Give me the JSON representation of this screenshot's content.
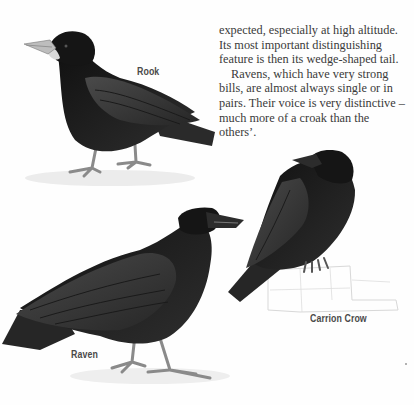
{
  "page": {
    "body_text": {
      "lines": [
        "expected, especially at high altitude.",
        "Its most important distinguishing",
        "feature is then its wedge-shaped tail.",
        "Ravens, which have very strong",
        "bills, are almost always single or in",
        "pairs. Their voice is very distinctive –",
        "much more of a croak than the",
        "others’."
      ]
    },
    "illustrations": [
      {
        "name": "rook",
        "label": "Rook"
      },
      {
        "name": "carrion-crow",
        "label": "Carrion Crow"
      },
      {
        "name": "raven",
        "label": "Raven"
      }
    ],
    "colors": {
      "plumage_dark": "#1a1a1a",
      "plumage_mid": "#3c3c3c",
      "plumage_light": "#5a5a5a",
      "bill_rook": "#bdbdbd",
      "legs": "#8a8a8a",
      "ground": "#e6e6e6",
      "text": "#3a3a3a"
    }
  }
}
